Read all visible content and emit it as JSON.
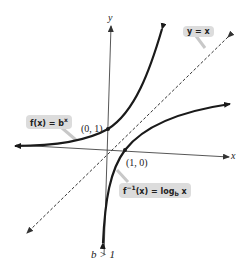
{
  "diagram": {
    "axes": {
      "x_label": "x",
      "y_label": "y"
    },
    "curves": [
      {
        "name": "exponential",
        "label_main": "f(x) = b",
        "label_sup": "x"
      },
      {
        "name": "logarithm",
        "label_pre": "f",
        "label_sup": "−1",
        "label_mid": "(x) = log",
        "label_sub": "b",
        "label_post": " x"
      },
      {
        "name": "identity-line",
        "label": "y = x",
        "style": "dashed"
      }
    ],
    "points": [
      {
        "label": "(0, 1)",
        "curve": "exponential"
      },
      {
        "label": "(1, 0)",
        "curve": "logarithm"
      }
    ],
    "condition": "b > 1",
    "colors": {
      "curve": "#1a1a1a",
      "axis": "#444444",
      "bubble_bg": "#dcdcdc",
      "leader": "#c8c8c8"
    }
  }
}
